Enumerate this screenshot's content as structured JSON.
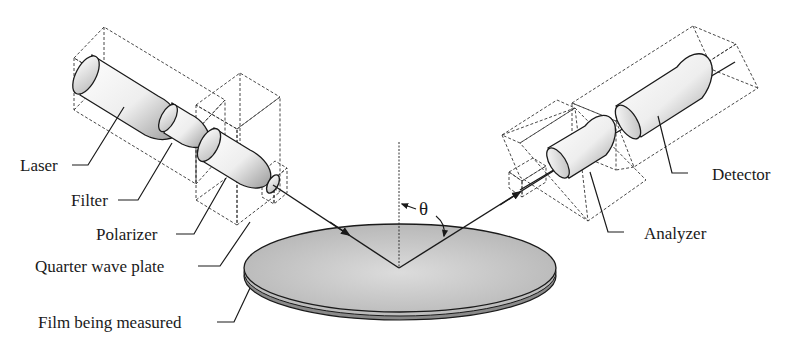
{
  "diagram": {
    "labels": {
      "laser": "Laser",
      "filter": "Filter",
      "polarizer": "Polarizer",
      "quarter_wave_plate": "Quarter wave plate",
      "film": "Film being measured",
      "analyzer": "Analyzer",
      "detector": "Detector",
      "angle": "θ"
    },
    "colors": {
      "line": "#1a1a1a",
      "dashed": "#333333",
      "disk_fill": "#c9c9c9",
      "background": "#ffffff"
    }
  }
}
